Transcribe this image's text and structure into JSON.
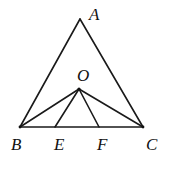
{
  "diagram": {
    "points": {
      "A": {
        "label": "A",
        "x": 80,
        "y": 19,
        "lx": 89,
        "ly": 20
      },
      "B": {
        "label": "B",
        "x": 20,
        "y": 127,
        "lx": 11,
        "ly": 150
      },
      "C": {
        "label": "C",
        "x": 143,
        "y": 127,
        "lx": 146,
        "ly": 150
      },
      "O": {
        "label": "O",
        "x": 79,
        "y": 89,
        "lx": 77,
        "ly": 81
      },
      "E": {
        "label": "E",
        "x": 55,
        "y": 127,
        "lx": 54,
        "ly": 150
      },
      "F": {
        "label": "F",
        "x": 99,
        "y": 127,
        "lx": 97,
        "ly": 150
      }
    },
    "segments": [
      "AB",
      "AC",
      "BC",
      "OB",
      "OC",
      "OE",
      "OF"
    ]
  }
}
